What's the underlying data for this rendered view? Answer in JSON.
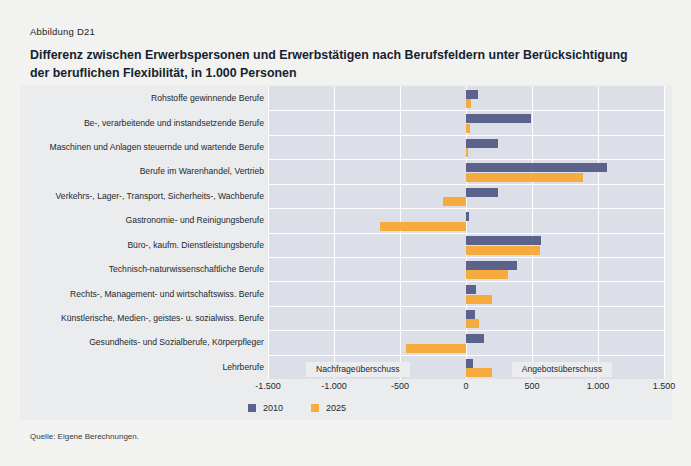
{
  "figure": {
    "number": "Abbildung D21",
    "title_line1": "Differenz zwischen Erwerbspersonen und Erwerbstätigen nach Berufsfeldern unter Berücksichtigung",
    "title_line2": "der beruflichen Flexibilität, in 1.000 Personen",
    "source": "Quelle: Eigene Berechnungen."
  },
  "annotations": {
    "demand_surplus": "Nachfrageüberschuss",
    "supply_surplus": "Angebotsüberschuss"
  },
  "colors": {
    "series_2010": "#5b638d",
    "series_2025": "#f5ab3d",
    "plot_background": "#dcdfe7",
    "panel_background": "#ebeced",
    "gridline": "#ffffff"
  },
  "chart_data": {
    "type": "bar",
    "orientation": "horizontal",
    "title": "Differenz zwischen Erwerbspersonen und Erwerbstätigen nach Berufsfeldern unter Berücksichtigung der beruflichen Flexibilität, in 1.000 Personen",
    "xlabel": "",
    "ylabel": "",
    "xlim": [
      -1500,
      1500
    ],
    "xticks": [
      -1500,
      -1000,
      -500,
      0,
      500,
      1000,
      1500
    ],
    "xticklabels": [
      "-1.500",
      "-1.000",
      "-500",
      "0",
      "500",
      "1.000",
      "1.500"
    ],
    "grid": true,
    "legend_position": "bottom-left",
    "categories": [
      "Rohstoffe gewinnende Berufe",
      "Be-, verarbeitende und instandsetzende Berufe",
      "Maschinen und Anlagen steuernde und wartende Berufe",
      "Berufe im Warenhandel, Vertrieb",
      "Verkehrs-, Lager-, Transport, Sicherheits-, Wachberufe",
      "Gastronomie- und Reinigungsberufe",
      "Büro-, kaufm. Dienstleistungsberufe",
      "Technisch-naturwissenschaftliche Berufe",
      "Rechts-, Management- und wirtschaftswiss. Berufe",
      "Künstlerische, Medien-, geistes- u. sozialwiss. Berufe",
      "Gesundheits- und Sozialberufe, Körperpfleger",
      "Lehrberufe"
    ],
    "series": [
      {
        "name": "2010",
        "color": "#5b638d",
        "values": [
          90,
          490,
          245,
          1070,
          240,
          20,
          570,
          390,
          75,
          65,
          135,
          55
        ]
      },
      {
        "name": "2025",
        "color": "#f5ab3d",
        "values": [
          35,
          30,
          15,
          890,
          -175,
          -655,
          560,
          315,
          200,
          95,
          -455,
          200
        ]
      }
    ]
  }
}
